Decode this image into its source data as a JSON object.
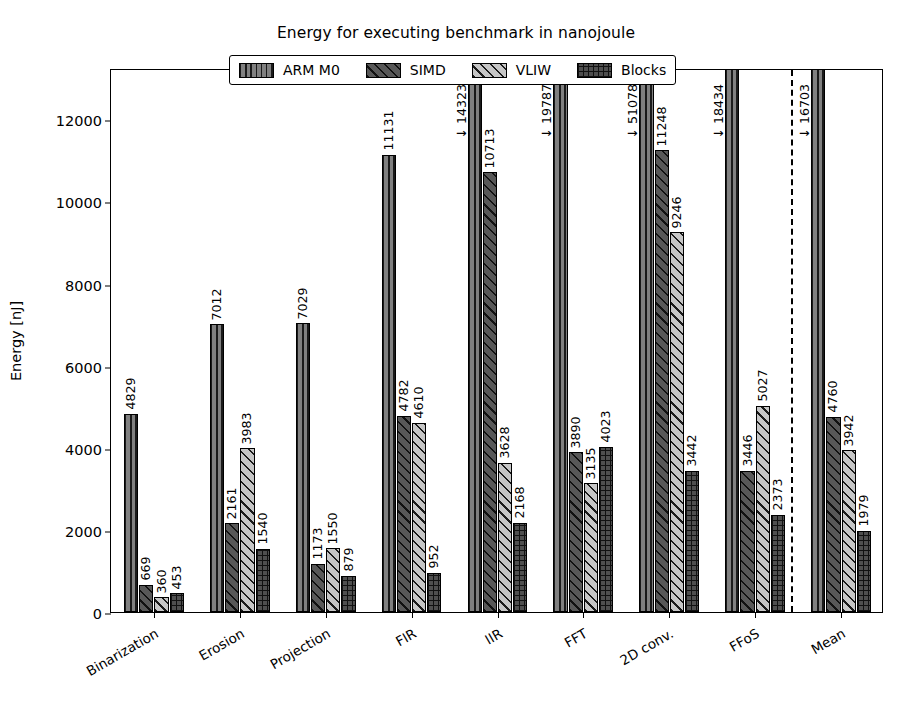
{
  "chart_data": {
    "type": "bar",
    "title": "Energy for executing benchmark in nanojoule",
    "xlabel": "",
    "ylabel": "Energy [nJ]",
    "ylim": [
      0,
      13250
    ],
    "yticks": [
      0,
      2000,
      4000,
      6000,
      8000,
      10000,
      12000
    ],
    "ytick_labels": [
      "0",
      "2000",
      "4000",
      "6000",
      "8000",
      "10000",
      "12000"
    ],
    "grid": false,
    "legend_position": "upper center",
    "categories": [
      "Binarization",
      "Erosion",
      "Projection",
      "FIR",
      "IIR",
      "FFT",
      "2D conv.",
      "FFoS",
      "Mean"
    ],
    "series": [
      {
        "name": "ARM M0",
        "color": "#808080",
        "hatch": "vertical-lines",
        "values": [
          4829,
          7012,
          7029,
          11131,
          14323,
          19787,
          51078,
          18434,
          16703
        ],
        "labels": [
          "4829",
          "7012",
          "7029",
          "11131",
          "",
          "",
          "",
          "",
          ""
        ],
        "clipped": [
          false,
          false,
          false,
          false,
          true,
          true,
          true,
          true,
          true
        ],
        "overflow_labels": [
          "",
          "",
          "",
          "",
          "↓ 14323",
          "↓ 19787",
          "↓ 51078",
          "↓ 18434",
          "↓ 16703"
        ]
      },
      {
        "name": "SIMD",
        "color": "#585858",
        "hatch": "diagonal-lines",
        "values": [
          669,
          2161,
          1173,
          4782,
          10713,
          3890,
          11248,
          3446,
          4760
        ],
        "labels": [
          "669",
          "2161",
          "1173",
          "4782",
          "10713",
          "3890",
          "11248",
          "3446",
          "4760"
        ],
        "clipped": [
          false,
          false,
          false,
          false,
          false,
          false,
          false,
          false,
          false
        ],
        "overflow_labels": [
          "",
          "",
          "",
          "",
          "",
          "",
          "",
          "",
          ""
        ]
      },
      {
        "name": "VLIW",
        "color": "#c6c6c6",
        "hatch": "diagonal-lines-light",
        "values": [
          360,
          3983,
          1550,
          4610,
          3628,
          3135,
          9246,
          5027,
          3942
        ],
        "labels": [
          "360",
          "3983",
          "1550",
          "4610",
          "3628",
          "3135",
          "9246",
          "5027",
          "3942"
        ],
        "clipped": [
          false,
          false,
          false,
          false,
          false,
          false,
          false,
          false,
          false
        ],
        "overflow_labels": [
          "",
          "",
          "",
          "",
          "",
          "",
          "",
          "",
          ""
        ]
      },
      {
        "name": "Blocks",
        "color": "#4f4f4f",
        "hatch": "crosshatch-grid",
        "values": [
          453,
          1540,
          879,
          952,
          2168,
          4023,
          3442,
          2373,
          1979
        ],
        "labels": [
          "453",
          "1540",
          "879",
          "952",
          "2168",
          "4023",
          "3442",
          "2373",
          "1979"
        ],
        "clipped": [
          false,
          false,
          false,
          false,
          false,
          false,
          false,
          false,
          false
        ],
        "overflow_labels": [
          "",
          "",
          "",
          "",
          "",
          "",
          "",
          "",
          ""
        ]
      }
    ],
    "separator": {
      "after_category": "FFoS",
      "style": "dashed"
    }
  }
}
